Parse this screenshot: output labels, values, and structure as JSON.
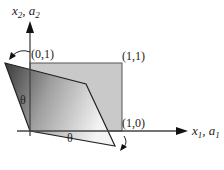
{
  "diagram": {
    "axes": {
      "y_label_main": "x",
      "y_label_sub1": "2",
      "y_label_sep": ", a",
      "y_label_sub2": "2",
      "x_label_main": "x",
      "x_label_sub1": "1",
      "x_label_sep": ", a",
      "x_label_sub2": "1"
    },
    "points": {
      "p01": "(0,1)",
      "p11": "(1,1)",
      "p10": "(1,0)"
    },
    "angles": {
      "left": "θ",
      "bottom": "θ"
    },
    "colors": {
      "square_fill": "#c8c8c8",
      "parallelogram_dark": "#3a3a3a",
      "parallelogram_light": "#f2f2f2",
      "axis": "#333333"
    }
  }
}
